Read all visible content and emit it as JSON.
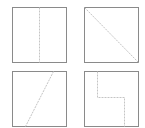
{
  "diagram": {
    "colors": {
      "border": "#8a8a8a",
      "dashed": "#c4c4c4",
      "background": "#ffffff"
    },
    "panels": [
      {
        "name": "panel-vertical-split",
        "box": [
          12,
          7,
          54,
          55
        ],
        "path": "M39.5 7.5 L39.5 62.5"
      },
      {
        "name": "panel-diagonal-split",
        "box": [
          84,
          7,
          54,
          55
        ],
        "path": "M84.5 7.5 L138.5 62.5"
      },
      {
        "name": "panel-slanted-split",
        "box": [
          12,
          71,
          54,
          55
        ],
        "path": "M53.5 71.5 L25.5 126.5"
      },
      {
        "name": "panel-step-split",
        "box": [
          84,
          71,
          54,
          55
        ],
        "path": "M97.5 71.5 L97.5 97.5 L124.5 97.5 L124.5 126.5"
      }
    ]
  }
}
